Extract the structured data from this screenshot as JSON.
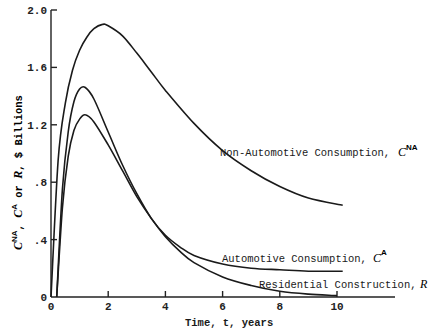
{
  "chart_data": {
    "type": "line",
    "title": "",
    "xlabel": "Time, t, years",
    "ylabel": "C^NA, C^A or R, $ Billions",
    "xlim": [
      0,
      12
    ],
    "ylim": [
      0,
      2.0
    ],
    "x_ticks": [
      "0",
      "2",
      "4",
      "6",
      "8",
      "10"
    ],
    "y_ticks": [
      "0",
      ".4",
      ".8",
      "1.2",
      "1.6",
      "2.0"
    ],
    "grid": false,
    "legend": "inline annotations",
    "series": [
      {
        "name": "Non-Automotive Consumption, C^NA",
        "label_text": "Non-Automotive Consumption,",
        "symbol": "C",
        "superscript": "NA",
        "x": [
          0,
          0.25,
          0.5,
          0.75,
          1.0,
          1.25,
          1.5,
          1.8,
          2.0,
          2.5,
          3.0,
          3.5,
          4.0,
          5.0,
          6.0,
          7.0,
          8.0,
          9.0,
          10.2
        ],
        "values": [
          0,
          0.95,
          1.35,
          1.58,
          1.72,
          1.81,
          1.87,
          1.9,
          1.89,
          1.82,
          1.7,
          1.57,
          1.44,
          1.21,
          1.02,
          0.88,
          0.77,
          0.69,
          0.64
        ]
      },
      {
        "name": "Automotive Consumption, C^A",
        "label_text": "Automotive Consumption,",
        "symbol": "C",
        "superscript": "A",
        "x": [
          0.2,
          0.4,
          0.6,
          0.8,
          1.0,
          1.2,
          1.5,
          2.0,
          2.5,
          3.0,
          3.5,
          4.0,
          4.5,
          5.0,
          6.0,
          7.0,
          8.0,
          9.0,
          10.2
        ],
        "values": [
          0,
          0.75,
          1.15,
          1.36,
          1.45,
          1.46,
          1.38,
          1.15,
          0.92,
          0.72,
          0.55,
          0.43,
          0.35,
          0.29,
          0.23,
          0.2,
          0.19,
          0.18,
          0.18
        ]
      },
      {
        "name": "Residential Construction, R",
        "label_text": "Residential Construction,",
        "symbol": "R",
        "superscript": "",
        "x": [
          0.2,
          0.4,
          0.6,
          0.8,
          1.0,
          1.2,
          1.5,
          2.0,
          2.5,
          3.0,
          3.5,
          4.0,
          4.5,
          5.0,
          6.0,
          7.0,
          8.0,
          9.0,
          10.0
        ],
        "values": [
          0,
          0.62,
          0.98,
          1.16,
          1.24,
          1.27,
          1.22,
          1.06,
          0.88,
          0.7,
          0.55,
          0.42,
          0.32,
          0.24,
          0.14,
          0.08,
          0.04,
          0.02,
          0.01
        ]
      }
    ]
  },
  "axes": {
    "x_title": "Time, t, years",
    "y_title_parts": {
      "c1": "C",
      "sup1": "NA",
      "sep1": ", ",
      "c2": "C",
      "sup2": "A",
      "sep2": " or ",
      "r": "R",
      "rest": ", $ Billions"
    }
  }
}
